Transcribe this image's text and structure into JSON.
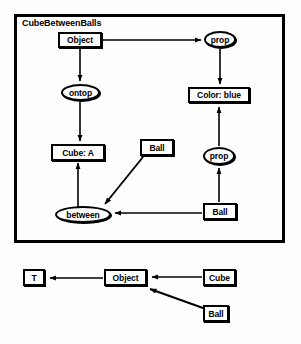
{
  "diagram": {
    "title": "CubeBetweenBalls",
    "frame": {
      "x": 14,
      "y": 14,
      "w": 271,
      "h": 229
    },
    "nodes": [
      {
        "id": "object-top",
        "label": "Object",
        "shape": "box",
        "x": 58,
        "y": 32,
        "w": 44,
        "h": 16
      },
      {
        "id": "prop-top",
        "label": "prop",
        "shape": "ellipse",
        "x": 204,
        "y": 31,
        "w": 32,
        "h": 17
      },
      {
        "id": "ontop",
        "label": "ontop",
        "shape": "ellipse",
        "x": 61,
        "y": 84,
        "w": 39,
        "h": 17
      },
      {
        "id": "color-blue",
        "label": "Color: blue",
        "shape": "box",
        "x": 188,
        "y": 87,
        "w": 62,
        "h": 16
      },
      {
        "id": "cube-a",
        "label": "Cube: A",
        "shape": "box",
        "x": 51,
        "y": 144,
        "w": 54,
        "h": 17
      },
      {
        "id": "ball-mid",
        "label": "Ball",
        "shape": "box",
        "x": 140,
        "y": 139,
        "w": 34,
        "h": 17
      },
      {
        "id": "prop-lower",
        "label": "prop",
        "shape": "ellipse",
        "x": 203,
        "y": 147,
        "w": 32,
        "h": 18
      },
      {
        "id": "between",
        "label": "between",
        "shape": "ellipse",
        "x": 55,
        "y": 206,
        "w": 56,
        "h": 17
      },
      {
        "id": "ball-right",
        "label": "Ball",
        "shape": "box",
        "x": 203,
        "y": 203,
        "w": 34,
        "h": 17
      }
    ],
    "edges": [
      {
        "from": "object-top",
        "to": "prop-top",
        "kind": "horizontal-right"
      },
      {
        "from": "object-top",
        "to": "ontop",
        "kind": "vertical-down"
      },
      {
        "from": "prop-top",
        "to": "color-blue",
        "kind": "vertical-down"
      },
      {
        "from": "ontop",
        "to": "cube-a",
        "kind": "vertical-down"
      },
      {
        "from": "between",
        "to": "cube-a",
        "kind": "vertical-up"
      },
      {
        "from": "ball-mid",
        "to": "between",
        "kind": "diagonal-down-left"
      },
      {
        "from": "ball-right",
        "to": "between",
        "kind": "horizontal-left"
      },
      {
        "from": "ball-right",
        "to": "prop-lower",
        "kind": "vertical-up"
      },
      {
        "from": "prop-lower",
        "to": "color-blue",
        "kind": "vertical-up"
      }
    ]
  },
  "lattice": {
    "nodes": [
      {
        "id": "t-node",
        "label": "T",
        "shape": "box",
        "x": 23,
        "y": 269,
        "w": 22,
        "h": 17
      },
      {
        "id": "object-bottom",
        "label": "Object",
        "shape": "box",
        "x": 104,
        "y": 269,
        "w": 43,
        "h": 17
      },
      {
        "id": "cube-bottom",
        "label": "Cube",
        "shape": "box",
        "x": 203,
        "y": 269,
        "w": 33,
        "h": 17
      },
      {
        "id": "ball-bottom",
        "label": "Ball",
        "shape": "box",
        "x": 203,
        "y": 305,
        "w": 26,
        "h": 17
      }
    ],
    "edges": [
      {
        "from": "object-bottom",
        "to": "t-node",
        "kind": "horizontal-left"
      },
      {
        "from": "cube-bottom",
        "to": "object-bottom",
        "kind": "horizontal-left"
      },
      {
        "from": "ball-bottom",
        "to": "object-bottom",
        "kind": "diagonal-up-left"
      }
    ]
  },
  "colors": {
    "stroke": "#000000",
    "node_fill": "#ffffff",
    "background": "#fefefe"
  }
}
